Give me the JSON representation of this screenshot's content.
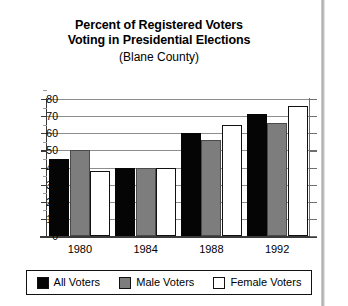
{
  "chart_data": {
    "type": "bar",
    "title": "Percent of Registered Voters Voting in Presidential Elections",
    "title_lines": [
      "Percent of Registered Voters",
      "Voting in Presidential Elections"
    ],
    "subtitle": "(Blane County)",
    "xlabel": "",
    "ylabel": "",
    "categories": [
      "1980",
      "1984",
      "1988",
      "1992"
    ],
    "series": [
      {
        "name": "All Voters",
        "color": "#050505",
        "values": [
          45,
          40,
          60,
          71
        ]
      },
      {
        "name": "Male Voters",
        "color": "#7d7d7d",
        "values": [
          50,
          40,
          56,
          66
        ]
      },
      {
        "name": "Female Voters",
        "color": "#ffffff",
        "values": [
          38,
          40,
          65,
          76
        ]
      }
    ],
    "ylim": [
      0,
      80
    ],
    "ytick_step": 10,
    "yticks": [
      "80",
      "70",
      "60",
      "50",
      "40",
      "30",
      "20",
      "10",
      "0"
    ],
    "grid": true,
    "legend_position": "bottom"
  },
  "legend": {
    "items": [
      {
        "label": "All Voters",
        "swatch": "s0"
      },
      {
        "label": "Male Voters",
        "swatch": "s1"
      },
      {
        "label": "Female Voters",
        "swatch": "s2"
      }
    ]
  }
}
